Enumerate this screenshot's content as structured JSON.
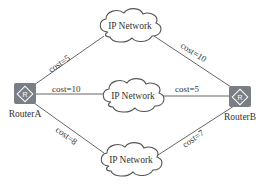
{
  "diagram": {
    "type": "network-topology",
    "colors": {
      "line": "#555555",
      "router_fill": "#7a7f86",
      "router_symbol": "#ffffff",
      "cloud_stroke": "#555555",
      "text": "#333333"
    },
    "routers": [
      {
        "id": "routerA",
        "label": "RouterA",
        "icon": "router-icon"
      },
      {
        "id": "routerB",
        "label": "RouterB",
        "icon": "router-icon"
      }
    ],
    "networks": [
      {
        "id": "net-top",
        "label": "IP Network",
        "icon": "cloud-icon"
      },
      {
        "id": "net-middle",
        "label": "IP Network",
        "icon": "cloud-icon"
      },
      {
        "id": "net-bottom",
        "label": "IP Network",
        "icon": "cloud-icon"
      }
    ],
    "links": [
      {
        "from": "RouterA",
        "to": "net-top",
        "label": "cost=5"
      },
      {
        "from": "net-top",
        "to": "RouterB",
        "label": "cost=10"
      },
      {
        "from": "RouterA",
        "to": "net-middle",
        "label": "cost=10"
      },
      {
        "from": "net-middle",
        "to": "RouterB",
        "label": "cost=5"
      },
      {
        "from": "RouterA",
        "to": "net-bottom",
        "label": "cost=8"
      },
      {
        "from": "net-bottom",
        "to": "RouterB",
        "label": "cost=7"
      }
    ]
  }
}
